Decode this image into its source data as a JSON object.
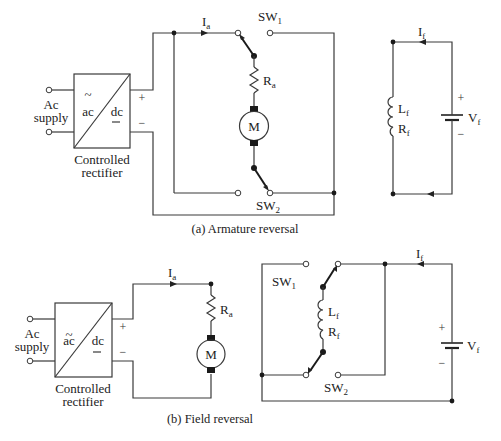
{
  "diagrams": [
    {
      "id": "a",
      "caption": "(a) Armature reversal",
      "source": {
        "label_line1": "Ac",
        "label_line2": "supply"
      },
      "rectifier": {
        "label_line1": "Controlled",
        "label_line2": "rectifier",
        "ac": "ac",
        "dc": "dc",
        "ac_symbol": "~",
        "dc_symbol": "—"
      },
      "polarity": {
        "plus": "+",
        "minus": "−"
      },
      "armature_current": {
        "main": "I",
        "sub": "a"
      },
      "resistor": {
        "main": "R",
        "sub": "a"
      },
      "motor": "M",
      "switches": [
        {
          "main": "SW",
          "sub": "1"
        },
        {
          "main": "SW",
          "sub": "2"
        }
      ],
      "field": {
        "current": {
          "main": "I",
          "sub": "f"
        },
        "inductance": {
          "main": "L",
          "sub": "f"
        },
        "resistance": {
          "main": "R",
          "sub": "f"
        },
        "voltage": {
          "main": "V",
          "sub": "f"
        },
        "plus": "+",
        "minus": "−"
      }
    },
    {
      "id": "b",
      "caption": "(b) Field reversal",
      "source": {
        "label_line1": "Ac",
        "label_line2": "supply"
      },
      "rectifier": {
        "label_line1": "Controlled",
        "label_line2": "rectifier",
        "ac": "ac",
        "dc": "dc",
        "ac_symbol": "~",
        "dc_symbol": "—"
      },
      "polarity": {
        "plus": "+",
        "minus": "−"
      },
      "armature_current": {
        "main": "I",
        "sub": "a"
      },
      "resistor": {
        "main": "R",
        "sub": "a"
      },
      "motor": "M",
      "switches": [
        {
          "main": "SW",
          "sub": "1"
        },
        {
          "main": "SW",
          "sub": "2"
        }
      ],
      "field": {
        "current": {
          "main": "I",
          "sub": "f"
        },
        "inductance": {
          "main": "L",
          "sub": "f"
        },
        "resistance": {
          "main": "R",
          "sub": "f"
        },
        "voltage": {
          "main": "V",
          "sub": "f"
        },
        "plus": "+",
        "minus": "−"
      }
    }
  ]
}
